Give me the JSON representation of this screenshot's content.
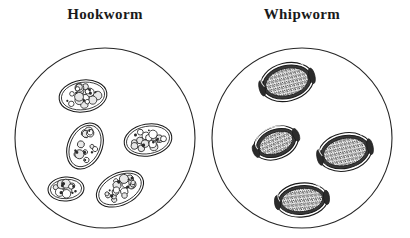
{
  "figure": {
    "background_color": "#ffffff",
    "ink_color": "#1a1a1a",
    "width": 410,
    "height": 238
  },
  "panels": [
    {
      "id": "hookworm",
      "label": "Hookworm",
      "field": {
        "cx": 105,
        "cy": 138,
        "r": 90,
        "stroke": "#262626",
        "stroke_width": 1.1,
        "fill": "#ffffff"
      },
      "egg_type": "morula-ovum",
      "egg_count": 5,
      "eggs": [
        {
          "cx": 83,
          "cy": 96,
          "rx": 24,
          "ry": 16,
          "rot": -8,
          "cells": 17
        },
        {
          "cx": 148,
          "cy": 140,
          "rx": 24,
          "ry": 16,
          "rot": -10,
          "cells": 16
        },
        {
          "cx": 85,
          "cy": 146,
          "rx": 17,
          "ry": 24,
          "rot": 24,
          "cells": 13
        },
        {
          "cx": 66,
          "cy": 189,
          "rx": 18,
          "ry": 12,
          "rot": -4,
          "cells": 10
        },
        {
          "cx": 120,
          "cy": 189,
          "rx": 25,
          "ry": 16,
          "rot": -26,
          "cells": 18
        }
      ]
    },
    {
      "id": "whipworm",
      "label": "Whipworm",
      "field": {
        "cx": 302,
        "cy": 138,
        "r": 90,
        "stroke": "#262626",
        "stroke_width": 1.1,
        "fill": "#ffffff"
      },
      "egg_type": "barrel-ovum-with-polar-plugs",
      "egg_count": 4,
      "eggs": [
        {
          "cx": 287,
          "cy": 82,
          "rx": 27,
          "ry": 19,
          "rot": -14
        },
        {
          "cx": 276,
          "cy": 143,
          "rx": 23,
          "ry": 16,
          "rot": -22
        },
        {
          "cx": 345,
          "cy": 152,
          "rx": 27,
          "ry": 19,
          "rot": -12
        },
        {
          "cx": 302,
          "cy": 200,
          "rx": 26,
          "ry": 17,
          "rot": -6
        }
      ]
    }
  ]
}
